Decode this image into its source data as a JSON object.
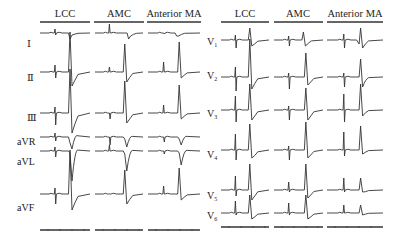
{
  "figure": {
    "left_panel": {
      "columns": [
        "LCC",
        "AMC",
        "Anterior MA"
      ],
      "leads": [
        "I",
        "II",
        "III",
        "aVR",
        "aVL",
        "aVF"
      ]
    },
    "right_panel": {
      "columns": [
        "LCC",
        "AMC",
        "Anterior MA"
      ],
      "leads": [
        "V1",
        "V2",
        "V3",
        "V4",
        "V5",
        "V6"
      ]
    },
    "colors": {
      "trace": "#333333",
      "background": "#ffffff"
    }
  },
  "chart_data": {
    "type": "line",
    "series_groups": [
      {
        "panel": "limb",
        "columns": [
          "LCC",
          "AMC",
          "Anterior MA"
        ],
        "leads": [
          "I",
          "II",
          "III",
          "aVR",
          "aVL",
          "aVF"
        ]
      },
      {
        "panel": "precordial",
        "columns": [
          "LCC",
          "AMC",
          "Anterior MA"
        ],
        "leads": [
          "V1",
          "V2",
          "V3",
          "V4",
          "V5",
          "V6"
        ]
      }
    ]
  }
}
